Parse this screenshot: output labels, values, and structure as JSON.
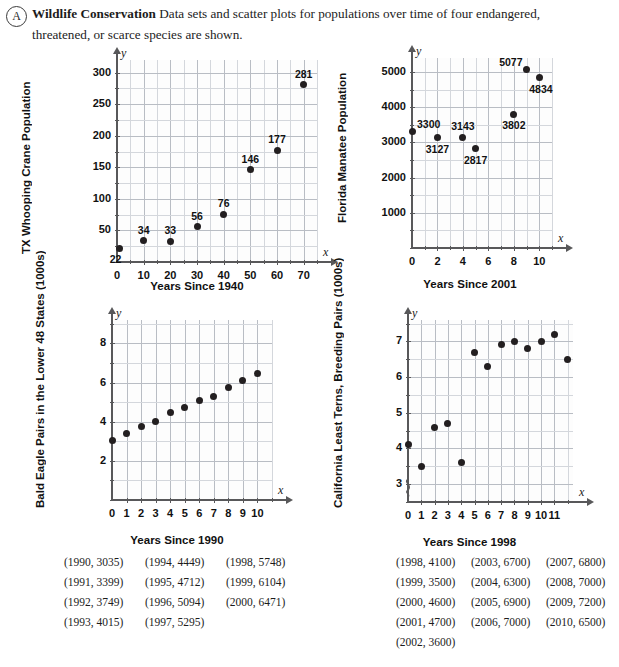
{
  "header": {
    "marker": "A",
    "title": "Wildlife Conservation",
    "body": "Data sets and scatter plots for populations over time of four endangered, threatened, or scarce species are shown."
  },
  "chart_data": [
    {
      "id": "whooping-crane",
      "type": "scatter",
      "title": "",
      "xlabel": "Years Since 1940",
      "ylabel": "TX Whooping Crane Population",
      "x_axis_symbol": "x",
      "y_axis_symbol": "y",
      "xlim": [
        0,
        75
      ],
      "ylim": [
        0,
        320
      ],
      "xticks": [
        0,
        10,
        20,
        30,
        40,
        50,
        60,
        70
      ],
      "yticks": [
        50,
        100,
        150,
        200,
        250,
        300
      ],
      "xminor_step": 5,
      "yminor_step": 25,
      "grid": true,
      "x": [
        1,
        10,
        20,
        30,
        40,
        50,
        60,
        70
      ],
      "y": [
        22,
        34,
        33,
        56,
        76,
        146,
        177,
        281
      ],
      "point_labels": [
        "22",
        "34",
        "33",
        "56",
        "76",
        "146",
        "177",
        "281"
      ],
      "label_pos": [
        "below-right",
        "above",
        "above",
        "above",
        "above",
        "above",
        "above",
        "above"
      ]
    },
    {
      "id": "florida-manatee",
      "type": "scatter",
      "title": "",
      "xlabel": "Years Since 2001",
      "ylabel": "Florida Manatee Population",
      "x_axis_symbol": "x",
      "y_axis_symbol": "y",
      "xlim": [
        0,
        11
      ],
      "ylim": [
        0,
        5400
      ],
      "xticks": [
        0,
        2,
        4,
        6,
        8,
        10
      ],
      "yticks": [
        1000,
        2000,
        3000,
        4000,
        5000
      ],
      "xminor_step": 1,
      "yminor_step": 500,
      "grid": true,
      "x": [
        0,
        2,
        4,
        5,
        8,
        9,
        10
      ],
      "y": [
        3300,
        3127,
        3143,
        2817,
        3802,
        5077,
        4834
      ],
      "point_labels": [
        "3300",
        "3127",
        "3143",
        "2817",
        "3802",
        "5077",
        "4834"
      ],
      "label_pos": [
        "right",
        "below",
        "above",
        "below",
        "below",
        "left",
        "below-right"
      ]
    },
    {
      "id": "bald-eagle",
      "type": "scatter",
      "title": "",
      "xlabel": "Years Since 1990",
      "ylabel": "Bald Eagle Pairs in the Lower 48 States (1000s)",
      "x_axis_symbol": "x",
      "y_axis_symbol": "y",
      "xlim": [
        0,
        11
      ],
      "ylim": [
        0,
        9.2
      ],
      "xticks": [
        0,
        1,
        2,
        3,
        4,
        5,
        6,
        7,
        8,
        9,
        10
      ],
      "yticks": [
        2,
        4,
        6,
        8
      ],
      "xminor_step": 1,
      "yminor_step": 1,
      "grid": true,
      "x": [
        0,
        1,
        2,
        3,
        4,
        5,
        6,
        7,
        8,
        9,
        10
      ],
      "y": [
        3.035,
        3.399,
        3.749,
        4.015,
        4.449,
        4.712,
        5.094,
        5.295,
        5.748,
        6.104,
        6.471
      ],
      "point_labels": [],
      "label_pos": []
    },
    {
      "id": "california-least-terns",
      "type": "scatter",
      "title": "",
      "xlabel": "Years Since 1998",
      "ylabel": "California Least Terns, Breeding Pairs (1000s)",
      "x_axis_symbol": "x",
      "y_axis_symbol": "y",
      "xlim": [
        0,
        12.4
      ],
      "ylim": [
        2.5,
        7.6
      ],
      "xticks": [
        0,
        1,
        2,
        3,
        4,
        5,
        6,
        7,
        8,
        9,
        10,
        11
      ],
      "yticks": [
        3,
        4,
        5,
        6,
        7
      ],
      "xminor_step": 1,
      "yminor_step": 0.5,
      "grid": true,
      "y_axis_break": true,
      "x": [
        0,
        1,
        2,
        3,
        4,
        5,
        6,
        7,
        8,
        9,
        10,
        11,
        12
      ],
      "y": [
        4.1,
        3.5,
        4.6,
        4.7,
        3.6,
        6.7,
        6.3,
        6.9,
        7.0,
        6.8,
        7.0,
        7.2,
        6.5
      ],
      "point_labels": [],
      "label_pos": []
    }
  ],
  "data_lists": {
    "bald_eagle": {
      "columns": [
        [
          "(1990, 3035)",
          "(1991, 3399)",
          "(1992, 3749)",
          "(1993, 4015)"
        ],
        [
          "(1994, 4449)",
          "(1995, 4712)",
          "(1996, 5094)",
          "(1997, 5295)"
        ],
        [
          "(1998, 5748)",
          "(1999, 6104)",
          "(2000, 6471)"
        ]
      ]
    },
    "least_terns": {
      "columns": [
        [
          "(1998, 4100)",
          "(1999, 3500)",
          "(2000, 4600)",
          "(2001, 4700)",
          "(2002, 3600)"
        ],
        [
          "(2003, 6700)",
          "(2004, 6300)",
          "(2005, 6900)",
          "(2006, 7000)"
        ],
        [
          "(2007, 6800)",
          "(2008, 7000)",
          "(2009, 7200)",
          "(2010, 6500)"
        ]
      ]
    }
  }
}
